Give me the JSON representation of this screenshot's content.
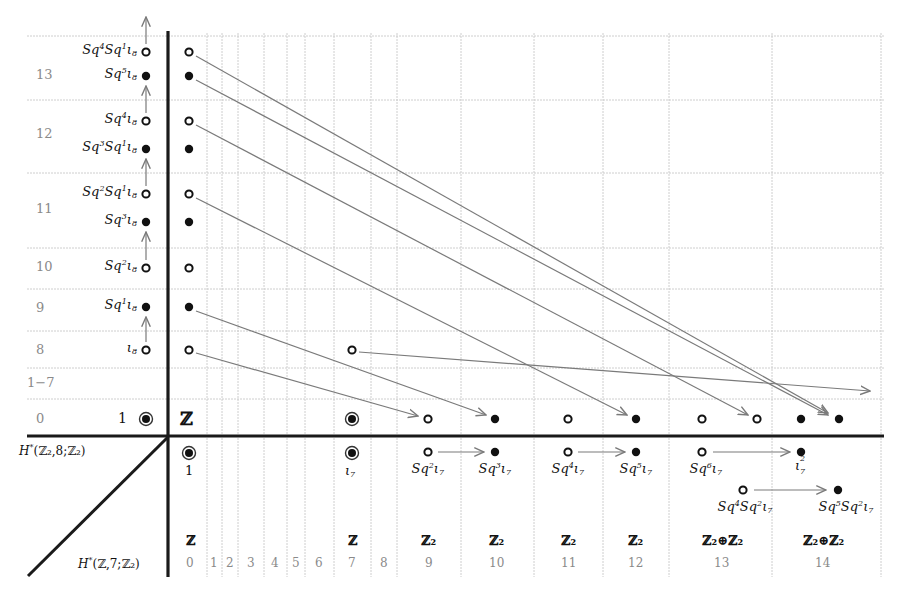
{
  "chart_data": {
    "type": "spectral_sequence",
    "x_axis_title": "H*(Z,7;Z2)",
    "y_axis_title": "H*(Z2,8;Z2)",
    "x_ticks": [
      "0",
      "1",
      "2",
      "3",
      "4",
      "5",
      "6",
      "7",
      "8",
      "9",
      "10",
      "11",
      "12",
      "13",
      "14"
    ],
    "y_ticks": [
      "0",
      "1−7",
      "8",
      "9",
      "10",
      "11",
      "12",
      "13"
    ],
    "x_axis_groups": [
      {
        "col": 0,
        "group": "Z"
      },
      {
        "col": 7,
        "group": "Z"
      },
      {
        "col": 9,
        "group": "Z2"
      },
      {
        "col": 10,
        "group": "Z2"
      },
      {
        "col": 11,
        "group": "Z2"
      },
      {
        "col": 12,
        "group": "Z2"
      },
      {
        "col": 13,
        "group": "Z2⊕Z2"
      },
      {
        "col": 14,
        "group": "Z2⊕Z2"
      }
    ],
    "fiber_classes": [
      {
        "deg": 0,
        "label": "1"
      },
      {
        "deg": 8,
        "label": "ι8"
      },
      {
        "deg": 9,
        "label": "Sq1ι8"
      },
      {
        "deg": 10,
        "label": "Sq2ι8"
      },
      {
        "deg": 11,
        "label": "Sq3ι8"
      },
      {
        "deg": 11,
        "label": "Sq2Sq1ι8"
      },
      {
        "deg": 12,
        "label": "Sq3Sq1ι8"
      },
      {
        "deg": 12,
        "label": "Sq4ι8"
      },
      {
        "deg": 13,
        "label": "Sq5ι8"
      },
      {
        "deg": 13,
        "label": "Sq4Sq1ι8"
      }
    ],
    "base_classes": [
      {
        "deg": 0,
        "label": "1"
      },
      {
        "deg": 7,
        "label": "ι7"
      },
      {
        "deg": 9,
        "label": "Sq2ι7"
      },
      {
        "deg": 10,
        "label": "Sq3ι7"
      },
      {
        "deg": 11,
        "label": "Sq4ι7"
      },
      {
        "deg": 12,
        "label": "Sq5ι7"
      },
      {
        "deg": 13,
        "label": "Sq6ι7"
      },
      {
        "deg": 13,
        "label": "Sq4Sq2ι7"
      },
      {
        "deg": 14,
        "label": "ι7²"
      },
      {
        "deg": 14,
        "label": "Sq5Sq2ι7"
      }
    ],
    "differentials": [
      {
        "from": [
          0,
          8
        ],
        "to": [
          9,
          0
        ]
      },
      {
        "from": [
          0,
          9
        ],
        "to": [
          10,
          0
        ]
      },
      {
        "from": [
          0,
          11
        ],
        "to": [
          12,
          0
        ]
      },
      {
        "from": [
          0,
          12
        ],
        "to": [
          13,
          0
        ]
      },
      {
        "from": [
          0,
          13
        ],
        "to": [
          14,
          0
        ]
      },
      {
        "from": [
          0,
          13
        ],
        "to": [
          14,
          0
        ]
      },
      {
        "from": [
          7,
          8
        ],
        "to": [
          16,
          0
        ]
      }
    ],
    "grid": true
  },
  "labels": {
    "row_nums": [
      {
        "text": "13",
        "y": 76
      },
      {
        "text": "12",
        "y": 135
      },
      {
        "text": "11",
        "y": 210
      },
      {
        "text": "10",
        "y": 268
      },
      {
        "text": "9",
        "y": 309
      },
      {
        "text": "8",
        "y": 351
      },
      {
        "text": "1−7",
        "y": 384
      },
      {
        "text": "0",
        "y": 420
      }
    ],
    "col_nums": [
      {
        "text": "0",
        "x": 190
      },
      {
        "text": "1",
        "x": 214
      },
      {
        "text": "2",
        "x": 230
      },
      {
        "text": "3",
        "x": 251
      },
      {
        "text": "4",
        "x": 275
      },
      {
        "text": "5",
        "x": 296
      },
      {
        "text": "6",
        "x": 319
      },
      {
        "text": "7",
        "x": 352
      },
      {
        "text": "8",
        "x": 384
      },
      {
        "text": "9",
        "x": 429
      },
      {
        "text": "10",
        "x": 497
      },
      {
        "text": "11",
        "x": 569
      },
      {
        "text": "12",
        "x": 636
      },
      {
        "text": "13",
        "x": 722
      },
      {
        "text": "14",
        "x": 823
      }
    ],
    "groups": [
      {
        "text": "ℤ",
        "x": 190
      },
      {
        "text": "ℤ",
        "x": 352
      },
      {
        "text": "ℤ₂",
        "x": 429
      },
      {
        "text": "ℤ₂",
        "x": 497
      },
      {
        "text": "ℤ₂",
        "x": 569
      },
      {
        "text": "ℤ₂",
        "x": 636
      },
      {
        "text": "ℤ₂⊕ℤ₂",
        "x": 722
      },
      {
        "text": "ℤ₂⊕ℤ₂",
        "x": 823
      }
    ],
    "fiber_labels": [
      {
        "base": "Sq",
        "sup1": "4",
        "mid": "Sq",
        "sup2": "1",
        "tail": "ι",
        "sub": "8",
        "y": 52
      },
      {
        "base": "Sq",
        "sup1": "5",
        "mid": "",
        "sup2": "",
        "tail": "ι",
        "sub": "8",
        "y": 76
      },
      {
        "base": "Sq",
        "sup1": "4",
        "mid": "",
        "sup2": "",
        "tail": "ι",
        "sub": "8",
        "y": 121
      },
      {
        "base": "Sq",
        "sup1": "3",
        "mid": "Sq",
        "sup2": "1",
        "tail": "ι",
        "sub": "8",
        "y": 149
      },
      {
        "base": "Sq",
        "sup1": "2",
        "mid": "Sq",
        "sup2": "1",
        "tail": "ι",
        "sub": "8",
        "y": 194
      },
      {
        "base": "Sq",
        "sup1": "3",
        "mid": "",
        "sup2": "",
        "tail": "ι",
        "sub": "8",
        "y": 222
      },
      {
        "base": "Sq",
        "sup1": "2",
        "mid": "",
        "sup2": "",
        "tail": "ι",
        "sub": "8",
        "y": 268
      },
      {
        "base": "Sq",
        "sup1": "1",
        "mid": "",
        "sup2": "",
        "tail": "ι",
        "sub": "8",
        "y": 307
      },
      {
        "base": "",
        "sup1": "",
        "mid": "",
        "sup2": "",
        "tail": "ι",
        "sub": "8",
        "y": 350
      }
    ],
    "unit_label": "1",
    "z_label": "ℤ",
    "base_one": "1",
    "iota7": {
      "tail": "ι",
      "sub": "7"
    },
    "base_labels": [
      {
        "base": "Sq",
        "sup1": "2",
        "mid": "",
        "sup2": "",
        "x": 428,
        "y": 470
      },
      {
        "base": "Sq",
        "sup1": "3",
        "mid": "",
        "sup2": "",
        "x": 495,
        "y": 470
      },
      {
        "base": "Sq",
        "sup1": "4",
        "mid": "",
        "sup2": "",
        "x": 568,
        "y": 470
      },
      {
        "base": "Sq",
        "sup1": "5",
        "mid": "",
        "sup2": "",
        "x": 636,
        "y": 470
      },
      {
        "base": "Sq",
        "sup1": "6",
        "mid": "",
        "sup2": "",
        "x": 706,
        "y": 470
      },
      {
        "base": "Sq",
        "sup1": "4",
        "mid": "Sq",
        "sup2": "2",
        "x": 745,
        "y": 508
      },
      {
        "base": "Sq",
        "sup1": "5",
        "mid": "Sq",
        "sup2": "2",
        "x": 846,
        "y": 508
      }
    ],
    "iota7_squared": {
      "tail": "ι",
      "sup": "2",
      "sub": "7"
    },
    "y_axis_title": {
      "pre": "H",
      "star": "*",
      "args": "(ℤ₂,8;ℤ₂)"
    },
    "x_axis_title": {
      "pre": "H",
      "star": "*",
      "args": "(ℤ,7;ℤ₂)"
    }
  },
  "colors": {
    "axis": "#1a1a1a",
    "grid": "#c8c8c8",
    "arrow": "#7a7a7a",
    "dot": "#111111",
    "tick_text": "#8a8a8a"
  }
}
